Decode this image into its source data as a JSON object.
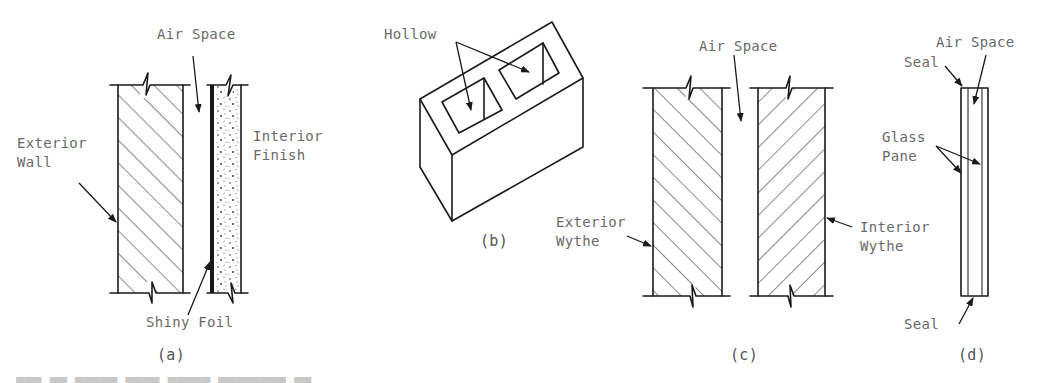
{
  "figure": {
    "panels": [
      {
        "id": "a",
        "caption": "(a)",
        "labels": {
          "air_space": "Air Space",
          "exterior_wall": "Exterior\nWall",
          "interior_finish": "Interior\nFinish",
          "shiny_foil": "Shiny Foil"
        }
      },
      {
        "id": "b",
        "caption": "(b)",
        "labels": {
          "hollow": "Hollow"
        }
      },
      {
        "id": "c",
        "caption": "(c)",
        "labels": {
          "air_space": "Air Space",
          "exterior_wythe": "Exterior\nWythe",
          "interior_wythe": "Interior\nWythe"
        }
      },
      {
        "id": "d",
        "caption": "(d)",
        "labels": {
          "air_space": "Air Space",
          "seal_top": "Seal",
          "glass_pane": "Glass\nPane",
          "seal_bottom": "Seal"
        }
      }
    ],
    "colors": {
      "line": "#1a1a1a",
      "label_text": "#6a6a6a",
      "background": "#ffffff"
    }
  }
}
